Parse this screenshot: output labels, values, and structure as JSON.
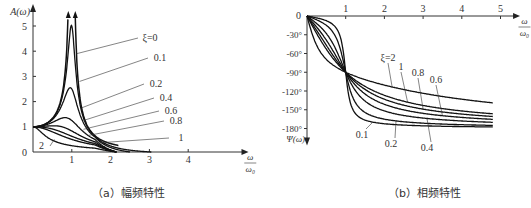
{
  "chart_data": [
    {
      "type": "line",
      "title": "幅频特性",
      "caption": "（a）幅频特性",
      "xlabel": "ω/ω₀",
      "xlabel_num": "ω",
      "xlabel_den": "ω₀",
      "ylabel": "A(ω)",
      "xlim": [
        0,
        5.2
      ],
      "ylim": [
        0,
        5.6
      ],
      "xticks": [
        1,
        2,
        3,
        4
      ],
      "yticks": [
        0,
        1,
        2,
        3,
        4,
        5
      ],
      "origin_label": "0",
      "formula": "A = 1/sqrt((1-u^2)^2 + (2*xi*u)^2)",
      "series": [
        {
          "name": "ξ=0",
          "label": "ξ=0",
          "xi": 0
        },
        {
          "name": "0.1",
          "label": "0.1",
          "xi": 0.1
        },
        {
          "name": "0.2",
          "label": "0.2",
          "xi": 0.2
        },
        {
          "name": "0.4",
          "label": "0.4",
          "xi": 0.4
        },
        {
          "name": "0.6",
          "label": "0.6",
          "xi": 0.6
        },
        {
          "name": "0.8",
          "label": "0.8",
          "xi": 0.8
        },
        {
          "name": "1",
          "label": "1",
          "xi": 1.0
        },
        {
          "name": "2",
          "label": "2",
          "xi": 2.0
        }
      ],
      "peaks": {
        "xi_0.1": 5.0,
        "xi_0.2": 2.5,
        "xi_0.4": 1.25
      }
    },
    {
      "type": "line",
      "title": "相频特性",
      "caption": "（b）相频特性",
      "xlabel": "ω/ω₀",
      "xlabel_num": "ω",
      "xlabel_den": "ω₀",
      "ylabel": "Ψ(ω)",
      "xlim": [
        0,
        5.2
      ],
      "ylim": [
        -195,
        0
      ],
      "xticks": [
        1,
        2,
        3,
        4,
        5
      ],
      "yticks": [
        -30,
        -60,
        -90,
        -120,
        -150,
        -180
      ],
      "ytick_labels": [
        "-30°",
        "-60°",
        "-90°",
        "-120°",
        "-150°",
        "-180°"
      ],
      "origin_label": "0",
      "crossing": {
        "x": 1,
        "y": -90
      },
      "series": [
        {
          "name": "0.1",
          "label": "0.1",
          "xi": 0.1
        },
        {
          "name": "0.2",
          "label": "0.2",
          "xi": 0.2
        },
        {
          "name": "0.4",
          "label": "0.4",
          "xi": 0.4
        },
        {
          "name": "0.6",
          "label": "0.6",
          "xi": 0.6
        },
        {
          "name": "0.8",
          "label": "0.8",
          "xi": 0.8
        },
        {
          "name": "1",
          "label": "1",
          "xi": 1.0
        },
        {
          "name": "ξ=2",
          "label": "ξ=2",
          "xi": 2.0
        }
      ]
    }
  ]
}
